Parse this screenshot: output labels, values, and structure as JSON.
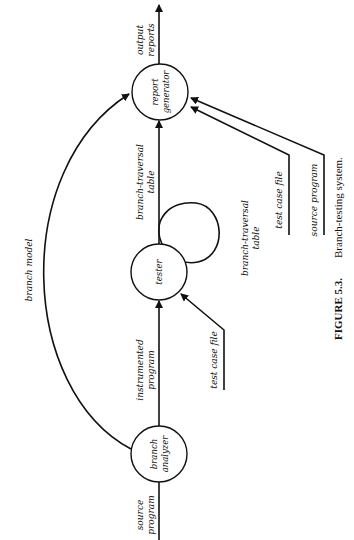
{
  "figure": {
    "number": "FIGURE 5.3.",
    "caption": "Branch-testing system."
  },
  "nodes": {
    "report_generator": {
      "line1": "report",
      "line2": "generator"
    },
    "tester": {
      "line1": "tester"
    },
    "branch_analyzer": {
      "line1": "branch",
      "line2": "analyzer"
    }
  },
  "flows": {
    "output_reports": {
      "line1": "output",
      "line2": "reports"
    },
    "branch_traversal_table_main": {
      "line1": "branch-traversal",
      "line2": "table"
    },
    "branch_traversal_table_loop": {
      "line1": "branch-traversal",
      "line2": "table"
    },
    "instrumented_program": {
      "line1": "instrumented",
      "line2": "program"
    },
    "source_program_in": {
      "line1": "source",
      "line2": "program"
    },
    "branch_model": {
      "line1": "branch model"
    },
    "test_case_file_report": {
      "line1": "test case file"
    },
    "source_program_report": {
      "line1": "source program"
    },
    "test_case_file_tester": {
      "line1": "test case file"
    }
  },
  "colors": {
    "ink": "#111111",
    "background": "#ffffff"
  }
}
